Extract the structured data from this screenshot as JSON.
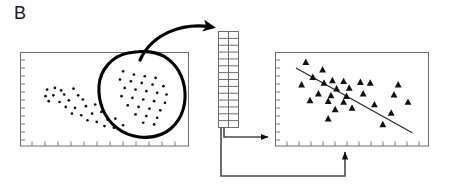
{
  "figure": {
    "panel_label": "B",
    "colors": {
      "axis": "#6e6e6e",
      "marker": "#111111",
      "blob_outline": "#000000",
      "arrow": "#000000",
      "grid_line": "#6e6e6e",
      "regression_line": "#2a2a2a",
      "background": "#ffffff"
    }
  },
  "chart_data": [
    {
      "id": "source-scatter",
      "type": "scatter",
      "title": "",
      "xlabel": "",
      "ylabel": "",
      "xlim": [
        0,
        100
      ],
      "ylim": [
        0,
        100
      ],
      "grid": false,
      "axis_style": "box-with-ticks",
      "marker": "circle",
      "annotation": "hand-drawn blob encircling the upper-right cluster",
      "series": [
        {
          "name": "background-cluster",
          "marker": "circle",
          "points": [
            [
              13,
              62
            ],
            [
              18,
              64
            ],
            [
              22,
              61
            ],
            [
              30,
              63
            ],
            [
              12,
              54
            ],
            [
              17,
              55
            ],
            [
              24,
              56
            ],
            [
              33,
              55
            ],
            [
              14,
              48
            ],
            [
              21,
              47
            ],
            [
              27,
              49
            ],
            [
              36,
              50
            ],
            [
              25,
              41
            ],
            [
              31,
              40
            ],
            [
              38,
              42
            ],
            [
              44,
              44
            ],
            [
              29,
              33
            ],
            [
              35,
              31
            ],
            [
              42,
              33
            ],
            [
              48,
              35
            ],
            [
              39,
              25
            ],
            [
              45,
              23
            ],
            [
              52,
              26
            ],
            [
              57,
              27
            ],
            [
              50,
              18
            ],
            [
              56,
              16
            ],
            [
              62,
              19
            ]
          ]
        },
        {
          "name": "selected-cluster",
          "marker": "circle",
          "points": [
            [
              62,
              84
            ],
            [
              69,
              80
            ],
            [
              76,
              78
            ],
            [
              83,
              76
            ],
            [
              60,
              74
            ],
            [
              67,
              72
            ],
            [
              74,
              70
            ],
            [
              81,
              68
            ],
            [
              88,
              66
            ],
            [
              63,
              64
            ],
            [
              70,
              62
            ],
            [
              77,
              60
            ],
            [
              84,
              58
            ],
            [
              90,
              56
            ],
            [
              61,
              54
            ],
            [
              68,
              52
            ],
            [
              75,
              50
            ],
            [
              82,
              48
            ],
            [
              89,
              46
            ],
            [
              65,
              43
            ],
            [
              72,
              41
            ],
            [
              79,
              39
            ],
            [
              86,
              37
            ],
            [
              70,
              32
            ],
            [
              77,
              30
            ],
            [
              84,
              28
            ],
            [
              75,
              22
            ],
            [
              82,
              20
            ]
          ]
        }
      ]
    },
    {
      "id": "result-scatter",
      "type": "scatter",
      "title": "",
      "xlabel": "",
      "ylabel": "",
      "xlim": [
        0,
        100
      ],
      "ylim": [
        0,
        100
      ],
      "grid": false,
      "axis_style": "box-with-ticks",
      "marker": "triangle",
      "fit_line": {
        "type": "linear-regression",
        "x_start": 10,
        "y_start": 88,
        "x_end": 93,
        "y_end": 10
      },
      "series": [
        {
          "name": "observations",
          "marker": "triangle",
          "points": [
            [
              17,
              95
            ],
            [
              29,
              86
            ],
            [
              22,
              77
            ],
            [
              36,
              73
            ],
            [
              14,
              68
            ],
            [
              30,
              70
            ],
            [
              44,
              72
            ],
            [
              56,
              71
            ],
            [
              63,
              70
            ],
            [
              83,
              68
            ],
            [
              39,
              63
            ],
            [
              48,
              64
            ],
            [
              26,
              57
            ],
            [
              35,
              55
            ],
            [
              46,
              54
            ],
            [
              58,
              57
            ],
            [
              80,
              56
            ],
            [
              20,
              49
            ],
            [
              33,
              48
            ],
            [
              44,
              47
            ],
            [
              38,
              38
            ],
            [
              50,
              40
            ],
            [
              66,
              44
            ],
            [
              78,
              34
            ],
            [
              33,
              27
            ],
            [
              72,
              20
            ],
            [
              90,
              47
            ]
          ]
        }
      ]
    }
  ],
  "elements": {
    "feature_grid": {
      "name": "feature-matrix",
      "columns": 2,
      "rows": 14,
      "description": "vertical two-column grid of cells"
    },
    "curved_arrow": {
      "name": "blob-to-grid-arrow",
      "direction": "up-right",
      "description": "curved arrow from encircled cluster to feature matrix"
    },
    "connector_right": {
      "name": "grid-to-plot-y-arrow",
      "direction": "right",
      "description": "arrow from grid into left edge of result plot"
    },
    "connector_bottom": {
      "name": "grid-to-plot-x-arrow",
      "direction": "up",
      "description": "arrow routed below into bottom edge of result plot"
    }
  }
}
